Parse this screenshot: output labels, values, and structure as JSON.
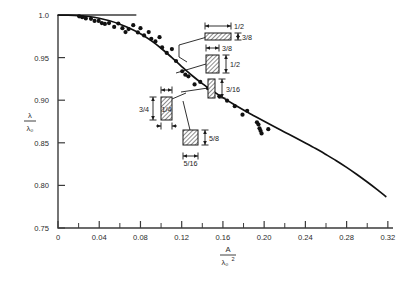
{
  "chart_data": {
    "type": "scatter",
    "title": "",
    "subtitle": "",
    "xlabel": "A / λ₀²",
    "xlabel_num": "A",
    "xlabel_den": "λ₀",
    "xlabel_den_exp": "2",
    "ylabel": "λ / λ₀",
    "ylabel_num": "λ",
    "ylabel_den": "λ₀",
    "xlim": [
      0,
      0.325
    ],
    "ylim": [
      0.75,
      1.0
    ],
    "grid": false,
    "legend": "none",
    "x_ticks_major": [
      0,
      0.04,
      0.08,
      0.12,
      0.16,
      0.2,
      0.24,
      0.28,
      0.32
    ],
    "x_tick_labels": [
      "0",
      "0.04",
      "0.08",
      "0.12",
      "0.16",
      "0.20",
      "0.24",
      "0.28",
      "0.32"
    ],
    "x_ticks_minor": [
      0.02,
      0.06,
      0.1,
      0.14,
      0.18,
      0.22,
      0.26,
      0.3
    ],
    "y_ticks_major": [
      0.75,
      0.8,
      0.85,
      0.9,
      0.95,
      1.0
    ],
    "y_tick_labels": [
      "0.75",
      "0.80",
      "0.85",
      "0.90",
      "0.95",
      "1.0"
    ],
    "series": [
      {
        "name": "measured",
        "marker": "filled-circle",
        "color": "#111111",
        "points": [
          [
            0.0205,
            0.9985
          ],
          [
            0.0235,
            0.9975
          ],
          [
            0.027,
            0.996
          ],
          [
            0.032,
            0.9955
          ],
          [
            0.0355,
            0.993
          ],
          [
            0.0395,
            0.993
          ],
          [
            0.0425,
            0.9905
          ],
          [
            0.0455,
            0.9895
          ],
          [
            0.0495,
            0.9905
          ],
          [
            0.0545,
            0.986
          ],
          [
            0.0585,
            0.99
          ],
          [
            0.0625,
            0.9845
          ],
          [
            0.0655,
            0.98
          ],
          [
            0.0685,
            0.9835
          ],
          [
            0.073,
            0.988
          ],
          [
            0.0775,
            0.9795
          ],
          [
            0.08,
            0.9845
          ],
          [
            0.0835,
            0.976
          ],
          [
            0.088,
            0.98
          ],
          [
            0.0905,
            0.972
          ],
          [
            0.0945,
            0.969
          ],
          [
            0.0985,
            0.974
          ],
          [
            0.101,
            0.962
          ],
          [
            0.1055,
            0.9555
          ],
          [
            0.1105,
            0.96
          ],
          [
            0.1145,
            0.946
          ],
          [
            0.1205,
            0.934
          ],
          [
            0.1235,
            0.93
          ],
          [
            0.1265,
            0.928
          ],
          [
            0.1325,
            0.9185
          ],
          [
            0.138,
            0.9215
          ],
          [
            0.1455,
            0.914
          ],
          [
            0.1505,
            0.908
          ],
          [
            0.1565,
            0.9045
          ],
          [
            0.164,
            0.8995
          ],
          [
            0.1715,
            0.893
          ],
          [
            0.179,
            0.883
          ],
          [
            0.1835,
            0.8875
          ],
          [
            0.193,
            0.874
          ],
          [
            0.1945,
            0.8715
          ],
          [
            0.1955,
            0.867
          ],
          [
            0.1965,
            0.864
          ],
          [
            0.1975,
            0.861
          ],
          [
            0.204,
            0.866
          ]
        ]
      }
    ],
    "fit_curve": {
      "name": "theoretical curve",
      "color": "#111111",
      "points": [
        [
          0.0,
          1.0
        ],
        [
          0.01,
          0.9998
        ],
        [
          0.02,
          0.9993
        ],
        [
          0.03,
          0.9982
        ],
        [
          0.04,
          0.9962
        ],
        [
          0.05,
          0.9932
        ],
        [
          0.06,
          0.9892
        ],
        [
          0.07,
          0.9842
        ],
        [
          0.08,
          0.978
        ],
        [
          0.09,
          0.9702
        ],
        [
          0.1,
          0.961
        ],
        [
          0.11,
          0.9505
        ],
        [
          0.12,
          0.9395
        ],
        [
          0.13,
          0.929
        ],
        [
          0.14,
          0.9195
        ],
        [
          0.15,
          0.911
        ],
        [
          0.16,
          0.903
        ],
        [
          0.17,
          0.8955
        ],
        [
          0.18,
          0.8885
        ],
        [
          0.19,
          0.8818
        ],
        [
          0.2,
          0.8752
        ],
        [
          0.21,
          0.8688
        ],
        [
          0.22,
          0.8625
        ],
        [
          0.23,
          0.8562
        ],
        [
          0.24,
          0.8498
        ],
        [
          0.25,
          0.8432
        ],
        [
          0.26,
          0.8362
        ],
        [
          0.27,
          0.829
        ],
        [
          0.28,
          0.8212
        ],
        [
          0.29,
          0.8128
        ],
        [
          0.3,
          0.804
        ],
        [
          0.31,
          0.7948
        ],
        [
          0.318,
          0.787
        ]
      ]
    },
    "annotations": [
      {
        "id": "cal-1",
        "shape": "hatched-rect",
        "orientation": "horizontal",
        "width_label": "1/2",
        "height_label": "3/8",
        "rect": {
          "x": 205,
          "y": 33,
          "w": 26,
          "h": 7
        },
        "leader": [
          [
            207,
            37
          ],
          [
            179,
            45
          ],
          [
            179,
            57
          ],
          [
            187,
            62
          ]
        ]
      },
      {
        "id": "cal-2",
        "shape": "hatched-rect",
        "orientation": "vertical",
        "width_label": "3/8",
        "height_label": "1/2",
        "rect": {
          "x": 206,
          "y": 55,
          "w": 13,
          "h": 18
        },
        "leader": [
          [
            206,
            64
          ],
          [
            176,
            73
          ]
        ]
      },
      {
        "id": "cal-3",
        "shape": "hatched-rect",
        "orientation": "vertical-narrow",
        "width_label": "",
        "height_label": "3/16",
        "rect": {
          "x": 208,
          "y": 79,
          "w": 7,
          "h": 19
        },
        "leader": [
          [
            208,
            88
          ],
          [
            181,
            92
          ]
        ]
      },
      {
        "id": "cal-4",
        "shape": "hatched-rect",
        "orientation": "vertical",
        "width_label": "1/4",
        "height_label": "3/4",
        "rect": {
          "x": 161,
          "y": 97,
          "w": 11,
          "h": 23
        },
        "leader": [
          [
            172,
            99
          ],
          [
            186,
            93
          ]
        ]
      },
      {
        "id": "cal-5",
        "shape": "hatched-rect",
        "orientation": "square",
        "width_label": "5/16",
        "height_label": "5/8",
        "rect": {
          "x": 183,
          "y": 130,
          "w": 15,
          "h": 15
        },
        "leader": [
          [
            190,
            130
          ],
          [
            183,
            101
          ]
        ]
      }
    ]
  },
  "figure": {
    "axis_color": "#3b3b3b",
    "curve_color": "#111111",
    "point_color": "#111111",
    "background": "#ffffff"
  }
}
